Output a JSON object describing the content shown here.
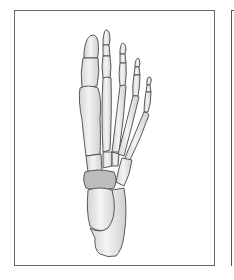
{
  "figure": {
    "colors": {
      "bone_fill": "#ececec",
      "bone_shade": "#c9c9c9",
      "outline": "#4a4a4a",
      "navicular": "#bdbdbd",
      "frame": "#6a6a6a",
      "background": "#ffffff"
    }
  }
}
